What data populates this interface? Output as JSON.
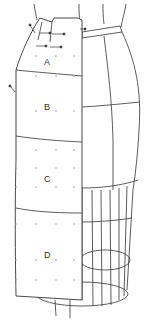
{
  "diagram": {
    "panel_labels": [
      "A",
      "B",
      "C",
      "D"
    ],
    "colors": {
      "line": "#333333",
      "dot": "#9a9a9a",
      "fabric": "#ffffff",
      "background": "#ffffff"
    }
  }
}
